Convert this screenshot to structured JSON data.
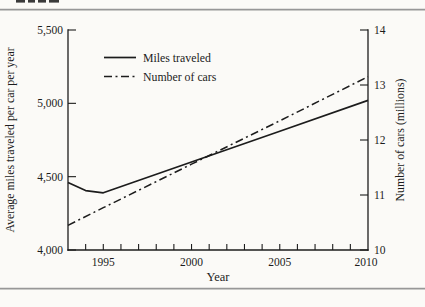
{
  "chart_data": {
    "type": "line",
    "title": "",
    "xlabel": "Year",
    "x_range": [
      1993,
      2010
    ],
    "x_tick_labels": [
      "1995",
      "2000",
      "2005",
      "2010"
    ],
    "x_minor_tick_years": [
      1994,
      1995,
      1996,
      1997,
      1998,
      1999,
      2000,
      2001,
      2002,
      2003,
      2004,
      2005,
      2006,
      2007,
      2008,
      2009
    ],
    "left_axis": {
      "label": "Average miles traveled per car per year",
      "range": [
        4000,
        5500
      ],
      "tick_values": [
        4000,
        4500,
        5000,
        5500
      ],
      "ticks_display": [
        "5,500",
        "5,000",
        "4,500",
        "4,000"
      ]
    },
    "right_axis": {
      "label": "Number of cars (millions)",
      "range": [
        10,
        14
      ],
      "tick_values": [
        10,
        11,
        12,
        13,
        14
      ],
      "ticks_display": [
        "14",
        "13",
        "12",
        "11",
        "10"
      ]
    },
    "legend": {
      "position": "upper-left-inside",
      "items": [
        {
          "label": "Miles traveled",
          "style": "solid"
        },
        {
          "label": "Number of cars",
          "style": "dash-dot"
        }
      ]
    },
    "series": [
      {
        "name": "Miles traveled",
        "axis": "left",
        "style": "solid",
        "x": [
          1993,
          1994,
          1995,
          2000,
          2005,
          2010
        ],
        "y": [
          4460,
          4405,
          4390,
          4600,
          4810,
          5020
        ]
      },
      {
        "name": "Number of cars",
        "axis": "right",
        "style": "dash-dot",
        "x": [
          1993,
          1995,
          2000,
          2005,
          2010
        ],
        "y": [
          10.45,
          10.77,
          11.56,
          12.35,
          13.15
        ]
      }
    ],
    "grid": false,
    "colors": {
      "line": "#1c1c1c",
      "text": "#1c1c1c",
      "rule": "#979797",
      "background": "#fbfaf7"
    }
  }
}
